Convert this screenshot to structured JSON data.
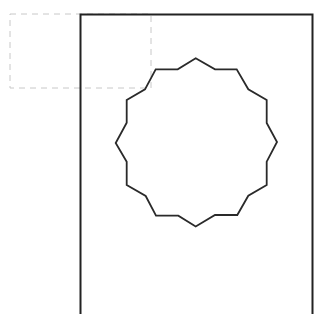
{
  "canvas": {
    "width": 322,
    "height": 320,
    "background": "#ffffff"
  },
  "dashed_rect": {
    "x": 10,
    "y": 14,
    "width": 141,
    "height": 74,
    "stroke": "#c8c8c8",
    "stroke_width": 1,
    "dash": "6,5"
  },
  "frame": {
    "points": "80.5,314 80.5,14.5 312.5,14.5 312.5,314",
    "stroke": "#222222",
    "stroke_width": 2
  },
  "polygon": {
    "points": "195.7,58.3 215,69.3 236.7,69.3 248.3,89.3 266.7,100 266.7,123 277,142 266.7,161.7 266.7,185 248.3,195.7 237.3,215 215,215 195.7,226.5 178.3,215.7 156,215.7 145.7,196 126.7,185 126.7,161.7 115.7,143 126.7,122.7 126.7,100 145,89.3 155.7,69.3 177.7,69.3",
    "stroke": "#2a2a2a",
    "stroke_width": 1.8,
    "fill": "none",
    "vertex_count": 24,
    "description": "12-pointed star-like polygon (dodecagram outline)"
  }
}
